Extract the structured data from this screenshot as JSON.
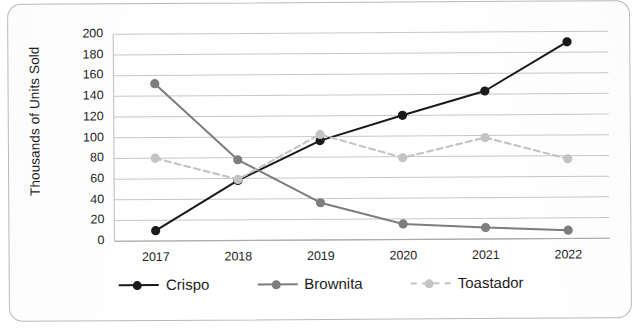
{
  "chart_data": {
    "type": "line",
    "title": "",
    "xlabel": "",
    "ylabel": "Thousands of Units Sold",
    "categories": [
      "2017",
      "2018",
      "2019",
      "2020",
      "2021",
      "2022"
    ],
    "ylim": [
      0,
      200
    ],
    "ytick_step": 20,
    "yticks": [
      "200",
      "180",
      "160",
      "140",
      "120",
      "100",
      "80",
      "60",
      "40",
      "20",
      "0"
    ],
    "grid": "horizontal",
    "legend_position": "bottom",
    "series": [
      {
        "name": "Crispo",
        "color": "#1a1a1a",
        "style": "solid",
        "marker": "circle",
        "values": [
          10,
          58,
          96,
          120,
          143,
          190
        ]
      },
      {
        "name": "Brownita",
        "color": "#7d7d7d",
        "style": "solid",
        "marker": "circle",
        "values": [
          152,
          78,
          36,
          15,
          11,
          8
        ]
      },
      {
        "name": "Toastador",
        "color": "#c4c4c4",
        "style": "dashed",
        "marker": "circle",
        "values": [
          80,
          59,
          102,
          79,
          98,
          77
        ]
      }
    ]
  },
  "legend": {
    "items": [
      {
        "label": "Crispo"
      },
      {
        "label": "Brownita"
      },
      {
        "label": "Toastador"
      }
    ]
  },
  "colors": {
    "crispo": "#1a1a1a",
    "brownita": "#7d7d7d",
    "toastador": "#c4c4c4",
    "grid": "#c8c8c8",
    "border": "#b9b9b9",
    "text": "#1c1c1c"
  }
}
